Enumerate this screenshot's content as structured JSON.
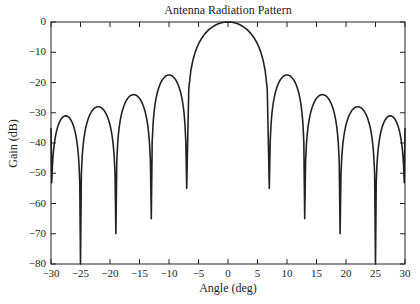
{
  "chart_data": {
    "type": "line",
    "title": "Antenna Radiation Pattern",
    "xlabel": "Angle (deg)",
    "ylabel": "Gain (dB)",
    "xlim": [
      -30,
      30
    ],
    "ylim": [
      -80,
      0
    ],
    "grid": false,
    "legend": null,
    "x_ticks": [
      -30,
      -25,
      -20,
      -15,
      -10,
      -5,
      0,
      5,
      10,
      15,
      20,
      25,
      30
    ],
    "y_ticks": [
      0,
      -10,
      -20,
      -30,
      -40,
      -50,
      -60,
      -70,
      -80
    ],
    "x_tick_labels": [
      "-30",
      "-25",
      "-20",
      "-15",
      "-10",
      "-5",
      "0",
      "5",
      "10",
      "15",
      "20",
      "25",
      "30"
    ],
    "y_tick_labels": [
      "0",
      "-10",
      "-20",
      "-30",
      "-40",
      "-50",
      "-60",
      "-70",
      "-80"
    ],
    "series": [
      {
        "name": "Gain",
        "color": "#222222",
        "main_lobe_peak": {
          "x": 0.5,
          "y": 0
        },
        "side_lobe_peaks": [
          {
            "x": -28.0,
            "y": -31
          },
          {
            "x": -22.0,
            "y": -28
          },
          {
            "x": -15.5,
            "y": -24
          },
          {
            "x": -9.5,
            "y": -17.5
          },
          {
            "x": 9.5,
            "y": -17.5
          },
          {
            "x": 15.5,
            "y": -24
          },
          {
            "x": 22.0,
            "y": -28
          },
          {
            "x": 28.0,
            "y": -31
          }
        ],
        "nulls": [
          {
            "x": -25.0,
            "y": -80
          },
          {
            "x": -19.0,
            "y": -70
          },
          {
            "x": -13.0,
            "y": -65
          },
          {
            "x": -7.0,
            "y": -55
          },
          {
            "x": 7.0,
            "y": -55
          },
          {
            "x": 13.0,
            "y": -65
          },
          {
            "x": 19.0,
            "y": -70
          },
          {
            "x": 25.0,
            "y": -80
          }
        ],
        "endpoints": [
          {
            "x": -30,
            "y": -35
          },
          {
            "x": 30,
            "y": -35
          }
        ]
      }
    ]
  }
}
